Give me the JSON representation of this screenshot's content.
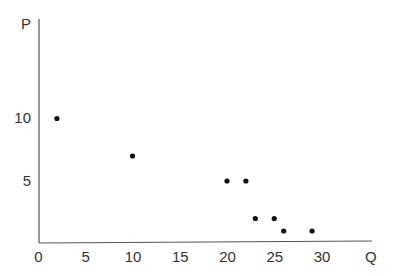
{
  "chart_data": {
    "type": "scatter",
    "title": "",
    "xlabel": "Q",
    "ylabel": "P",
    "x_ticks": [
      0,
      5,
      10,
      15,
      20,
      25,
      30
    ],
    "y_ticks": [
      5,
      10
    ],
    "xlim": [
      0,
      33
    ],
    "ylim": [
      0,
      15
    ],
    "grid": false,
    "legend": null,
    "points": [
      {
        "x": 2,
        "y": 10
      },
      {
        "x": 10,
        "y": 7
      },
      {
        "x": 20,
        "y": 5
      },
      {
        "x": 22,
        "y": 5
      },
      {
        "x": 23,
        "y": 2
      },
      {
        "x": 25,
        "y": 2
      },
      {
        "x": 26,
        "y": 1
      },
      {
        "x": 29,
        "y": 1
      }
    ],
    "color": "#111111"
  }
}
